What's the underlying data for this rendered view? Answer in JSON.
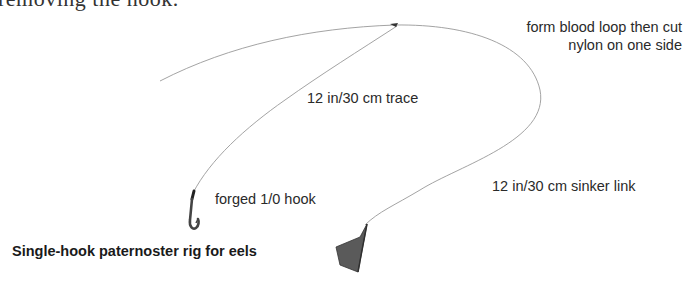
{
  "partial_text": "removing the hook.",
  "diagram": {
    "title": "Single-hook paternoster rig for eels",
    "labels": {
      "knot": [
        "form blood loop then cut",
        "nylon on one side"
      ],
      "trace": "12 in/30 cm trace",
      "sinker_link": "12 in/30 cm sinker link",
      "hook": "forged 1/0 hook"
    },
    "components": [
      "main-line",
      "blood-loop-knot",
      "trace",
      "hook",
      "sinker-link",
      "sinker"
    ],
    "colors": {
      "line": "#888888",
      "hook": "#444444",
      "sinker": "#555555",
      "text": "#2a2a2a"
    }
  }
}
